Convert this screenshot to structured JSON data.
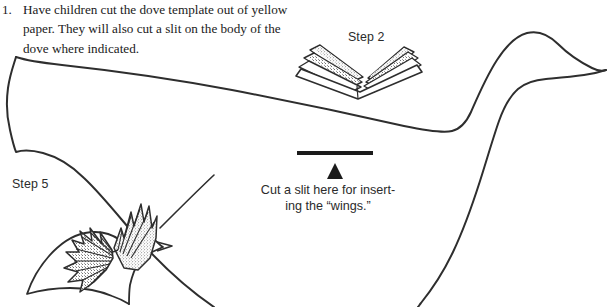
{
  "page": {
    "width": 609,
    "height": 307,
    "background_color": "#ffffff",
    "ink_color": "#2b2b2b"
  },
  "instruction": {
    "number": "1.",
    "text": "Have children cut the dove template out of yellow paper. They will also cut a slit on the body of the dove where indicated.",
    "lines": [
      "Have children cut the dove template out of",
      "yellow paper. They will also cut a slit on",
      "the body of the dove where indicated."
    ]
  },
  "labels": {
    "step2": "Step 2",
    "step5": "Step 5"
  },
  "slit_caption": {
    "line1": "Cut a slit here for insert-",
    "line2": "ing the “wings.”",
    "full": "Cut a slit here for inserting the “wings.”"
  },
  "figures": {
    "dove_template": "large dove body outline template",
    "accordion_fold": "fan-folded paper strip for wings",
    "finished_dove": "small dove with fan-folded wings inserted",
    "slit_mark": "solid black slit bar",
    "slit_arrow": "upward pointing triangle arrow"
  }
}
